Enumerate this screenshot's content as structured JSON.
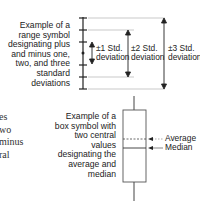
{
  "range_symbol": {
    "description": "Example of a\nrange symbol\ndesignating plus\nand minus one,\ntwo, and three\nstandard\ndeviations",
    "labels": {
      "std1": "±1 Std.\ndeviation",
      "std2": "±2 Std.\ndeviation",
      "std3": "±3 Std.\ndeviation"
    }
  },
  "box_symbol": {
    "description": "Example of a\nbox symbol with\ntwo central\nvalues\ndesignating the\naverage and\nmedian",
    "labels": {
      "average": "Average",
      "median": "Median"
    }
  },
  "cropped_text": {
    "fragments": "es\nwo\nminus\nral"
  },
  "colors": {
    "line": "#222222",
    "guide": "#bbbbbb",
    "text": "#222222"
  }
}
